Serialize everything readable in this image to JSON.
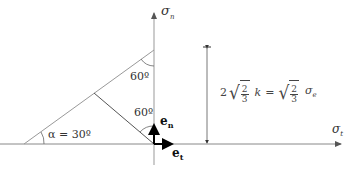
{
  "diagram": {
    "axes": {
      "vertical_label": "σ",
      "vertical_sub": "n",
      "horizontal_label": "σ",
      "horizontal_sub": "t"
    },
    "angles": {
      "alpha_label": "α = 30º",
      "top_angle": "60º",
      "bottom_angle": "60º"
    },
    "vectors": {
      "normal_label": "e",
      "normal_sub": "n",
      "tangent_label": "e",
      "tangent_sub": "t"
    },
    "dimension": {
      "lhs_coef": "2",
      "frac_num": "2",
      "frac_den": "3",
      "lhs_var": "k",
      "equals": "=",
      "rhs_frac_num": "2",
      "rhs_frac_den": "3",
      "rhs_var": "σ",
      "rhs_sub": "e"
    },
    "colors": {
      "axis": "#999999",
      "lines": "#555555",
      "vectors": "#000000",
      "text": "#333333"
    }
  }
}
